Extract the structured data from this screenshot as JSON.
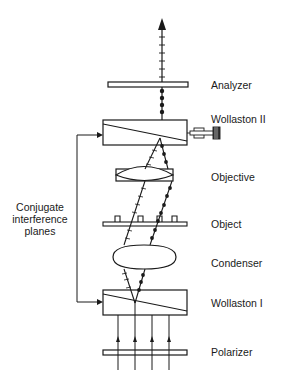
{
  "diagram": {
    "components": [
      {
        "id": "analyzer",
        "label": "Analyzer"
      },
      {
        "id": "wollaston-2",
        "label": "Wollaston II"
      },
      {
        "id": "objective",
        "label": "Objective"
      },
      {
        "id": "object",
        "label": "Object"
      },
      {
        "id": "condenser",
        "label": "Condenser"
      },
      {
        "id": "wollaston-1",
        "label": "Wollaston I"
      },
      {
        "id": "polarizer",
        "label": "Polarizer"
      }
    ],
    "side_label": {
      "line1": "Conjugate",
      "line2": "interference",
      "line3": "planes"
    },
    "colors": {
      "stroke": "#1a1a1a",
      "background": "#ffffff"
    }
  }
}
